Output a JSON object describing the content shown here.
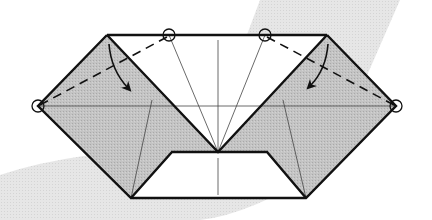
{
  "diagram": {
    "title": "Origami fold step: fold top corners down along valley folds",
    "type": "origami-instruction",
    "colors": {
      "background": "#ffffff",
      "backdrop_shape": "#e2e2e2",
      "paper_colored_side": "#bdbdbd",
      "paper_white_side": "#ffffff",
      "outline": "#111111",
      "crease": "#444444"
    },
    "elements": {
      "left_flap": {
        "label": "left-colored-flap",
        "points": [
          [
            107,
            35
          ],
          [
            38,
            106
          ],
          [
            131,
            198
          ],
          [
            172,
            152
          ],
          [
            218,
            152
          ]
        ]
      },
      "right_flap": {
        "label": "right-colored-flap",
        "points": [
          [
            327,
            35
          ],
          [
            396,
            106
          ],
          [
            306,
            198
          ],
          [
            267,
            152
          ],
          [
            218,
            152
          ]
        ]
      },
      "center_white_triangle": {
        "label": "center-white-area",
        "points": [
          [
            107,
            35
          ],
          [
            327,
            35
          ],
          [
            218,
            152
          ]
        ]
      },
      "bottom_trapezoid": {
        "label": "bottom-white-trapezoid",
        "points": [
          [
            172,
            152
          ],
          [
            267,
            152
          ],
          [
            306,
            198
          ],
          [
            131,
            198
          ]
        ]
      },
      "valley_folds": [
        {
          "label": "left-valley-fold",
          "from": [
            38,
            106
          ],
          "to": [
            169,
            35
          ]
        },
        {
          "label": "right-valley-fold",
          "from": [
            265,
            35
          ],
          "to": [
            396,
            106
          ]
        }
      ],
      "reference_circles": [
        {
          "label": "left-corner-marker",
          "cx": 38,
          "cy": 106
        },
        {
          "label": "top-left-marker",
          "cx": 169,
          "cy": 35
        },
        {
          "label": "top-right-marker",
          "cx": 265,
          "cy": 35
        },
        {
          "label": "right-corner-marker",
          "cx": 396,
          "cy": 106
        }
      ],
      "fold_arrows": [
        {
          "label": "left-fold-arrow",
          "direction": "down"
        },
        {
          "label": "right-fold-arrow",
          "direction": "down"
        }
      ]
    }
  }
}
